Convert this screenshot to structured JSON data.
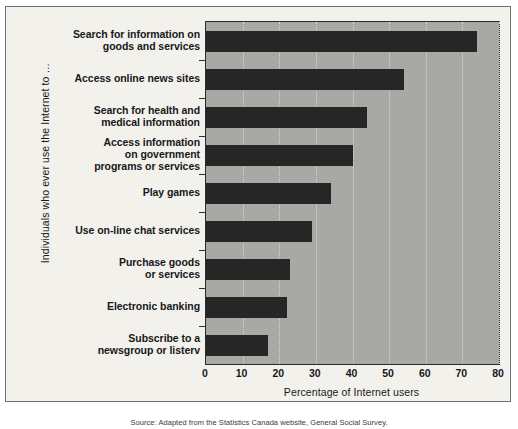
{
  "chart_data": {
    "type": "bar",
    "orientation": "horizontal",
    "title": "",
    "xlabel": "Percentage of Internet users",
    "ylabel": "Individuals who ever use the Internet to …",
    "xlim": [
      0,
      80
    ],
    "xticks": [
      0,
      10,
      20,
      30,
      40,
      50,
      60,
      70,
      80
    ],
    "grid": true,
    "legend": false,
    "bar_color": "#262626",
    "plot_background": "#a8a8a4",
    "figure_background": "#f2f1ec",
    "categories": [
      "Search for information on goods and services",
      "Access online news sites",
      "Search for health and medical information",
      "Access information on government programs or services",
      "Play games",
      "Use on-line chat services",
      "Purchase goods or services",
      "Electronic banking",
      "Subscribe to a newsgroup or listerv"
    ],
    "category_lines": [
      [
        "Search for information on",
        "goods and services"
      ],
      [
        "Access online news sites"
      ],
      [
        "Search for health and",
        "medical information"
      ],
      [
        "Access information",
        "on government",
        "programs or services"
      ],
      [
        "Play games"
      ],
      [
        "Use on-line chat services"
      ],
      [
        "Purchase goods",
        "or services"
      ],
      [
        "Electronic banking"
      ],
      [
        "Subscribe to a",
        "newsgroup or listerv"
      ]
    ],
    "values": [
      74,
      54,
      44,
      40,
      34,
      29,
      23,
      22,
      17
    ]
  },
  "caption": "Source: Adapted from the Statistics Canada website, General Social Survey."
}
